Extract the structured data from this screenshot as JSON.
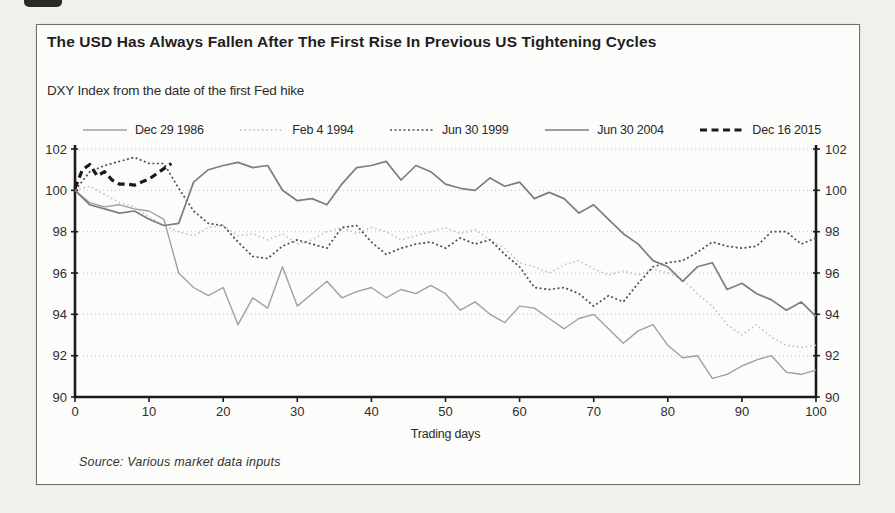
{
  "chart_data": {
    "type": "line",
    "title": "The USD Has Always Fallen After The First Rise In Previous US Tightening Cycles",
    "subtitle": "DXY Index from the date of the first Fed hike",
    "xlabel": "Trading days",
    "ylabel": "",
    "source": "Source: Various market data inputs",
    "xlim": [
      0,
      100
    ],
    "ylim": [
      90,
      102
    ],
    "xticks": [
      0,
      10,
      20,
      30,
      40,
      50,
      60,
      70,
      80,
      90,
      100
    ],
    "yticks": [
      90,
      92,
      94,
      96,
      98,
      100,
      102
    ],
    "grid": "horizontal-dotted",
    "legend_position": "top",
    "dual_y_axis": true,
    "axis_color": "#1b1b1b",
    "grid_color": "#c6c6c2",
    "tick_label_color": "#2e2e2e",
    "series": [
      {
        "name": "Dec 29 1986",
        "color": "#a0a0a0",
        "style": "solid",
        "dash": "",
        "width": 1.4,
        "x_start": 0,
        "x_step": 2,
        "values": [
          100,
          99.4,
          99.2,
          99.3,
          99.1,
          99.0,
          98.6,
          96.0,
          95.3,
          94.9,
          95.3,
          93.5,
          94.8,
          94.3,
          96.3,
          94.4,
          95.0,
          95.6,
          94.8,
          95.1,
          95.3,
          94.8,
          95.2,
          95.0,
          95.4,
          95.0,
          94.2,
          94.6,
          94.0,
          93.6,
          94.4,
          94.3,
          93.8,
          93.3,
          93.8,
          94.0,
          93.3,
          92.6,
          93.2,
          93.5,
          92.5,
          91.9,
          92.0,
          90.9,
          91.1,
          91.5,
          91.8,
          92.0,
          91.2,
          91.1,
          91.3
        ]
      },
      {
        "name": "Feb 4 1994",
        "color": "#bfbfbf",
        "style": "dotted",
        "dash": "1.6 2.8",
        "width": 1.5,
        "x_start": 0,
        "x_step": 2,
        "values": [
          100,
          100.2,
          99.8,
          99.4,
          99.2,
          98.7,
          98.3,
          98.0,
          97.8,
          98.2,
          98.3,
          97.8,
          97.9,
          97.6,
          97.9,
          97.4,
          97.6,
          98.0,
          98.2,
          97.9,
          98.2,
          98.0,
          97.6,
          97.8,
          98.0,
          98.2,
          97.9,
          98.1,
          97.6,
          97.2,
          96.5,
          96.3,
          96.0,
          96.4,
          96.6,
          96.2,
          95.9,
          96.1,
          95.9,
          96.2,
          96.0,
          95.7,
          95.0,
          94.4,
          93.5,
          93.0,
          93.5,
          92.9,
          92.5,
          92.4,
          92.5
        ]
      },
      {
        "name": "Jun 30 1999",
        "color": "#4d4d4d",
        "style": "dotted",
        "dash": "2 2.5",
        "width": 1.7,
        "x_start": 0,
        "x_step": 2,
        "values": [
          100,
          100.9,
          101.2,
          101.4,
          101.6,
          101.3,
          101.3,
          100.1,
          99.0,
          98.4,
          98.3,
          97.5,
          96.8,
          96.7,
          97.3,
          97.6,
          97.4,
          97.2,
          98.2,
          98.3,
          97.5,
          96.9,
          97.2,
          97.4,
          97.5,
          97.2,
          97.7,
          97.4,
          97.6,
          96.9,
          96.3,
          95.3,
          95.2,
          95.3,
          95.0,
          94.4,
          94.9,
          94.6,
          95.5,
          96.3,
          96.5,
          96.6,
          97.0,
          97.5,
          97.3,
          97.2,
          97.3,
          98.0,
          98.0,
          97.4,
          97.7
        ]
      },
      {
        "name": "Jun 30 2004",
        "color": "#7e7e7e",
        "style": "solid",
        "dash": "",
        "width": 1.7,
        "x_start": 0,
        "x_step": 2,
        "values": [
          100,
          99.3,
          99.1,
          98.9,
          99.0,
          98.6,
          98.3,
          98.4,
          100.4,
          101.0,
          101.2,
          101.35,
          101.1,
          101.2,
          100.0,
          99.5,
          99.6,
          99.3,
          100.3,
          101.1,
          101.2,
          101.4,
          100.5,
          101.2,
          100.9,
          100.3,
          100.1,
          100.0,
          100.6,
          100.2,
          100.4,
          99.6,
          99.9,
          99.6,
          98.9,
          99.3,
          98.6,
          97.9,
          97.4,
          96.6,
          96.3,
          95.6,
          96.3,
          96.5,
          95.2,
          95.5,
          95.0,
          94.7,
          94.2,
          94.6,
          93.9
        ]
      },
      {
        "name": "Dec 16 2015",
        "color": "#1a1a1a",
        "style": "dashed",
        "dash": "7 4.5",
        "width": 3.2,
        "x_start": 0,
        "x_step": 1,
        "values": [
          100.1,
          101.0,
          101.25,
          100.7,
          100.9,
          100.5,
          100.3,
          100.3,
          100.25,
          100.4,
          100.55,
          100.8,
          101.05,
          101.3
        ]
      }
    ]
  }
}
